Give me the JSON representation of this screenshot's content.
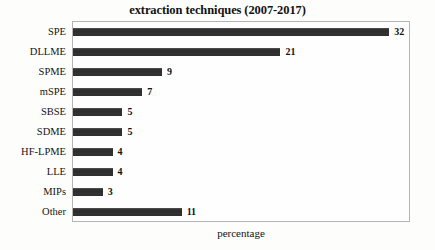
{
  "chart_data": {
    "type": "bar",
    "orientation": "horizontal",
    "title": "extraction techniques (2007-2017)",
    "xlabel": "percentage",
    "ylabel": "",
    "categories": [
      "SPE",
      "DLLME",
      "SPME",
      "mSPE",
      "SBSE",
      "SDME",
      "HF-LPME",
      "LLE",
      "MIPs",
      "Other"
    ],
    "values": [
      32,
      21,
      9,
      7,
      5,
      5,
      4,
      4,
      3,
      11
    ],
    "value_labels": [
      "32",
      "21",
      "9",
      "7",
      "5",
      "5",
      "4",
      "4",
      "3",
      "11"
    ],
    "xlim": [
      0,
      34
    ],
    "grid": false,
    "legend": false,
    "bar_color": "#2e2e2e",
    "frame_color": "#b4b4b4",
    "background_color": "#fdfdfb"
  }
}
